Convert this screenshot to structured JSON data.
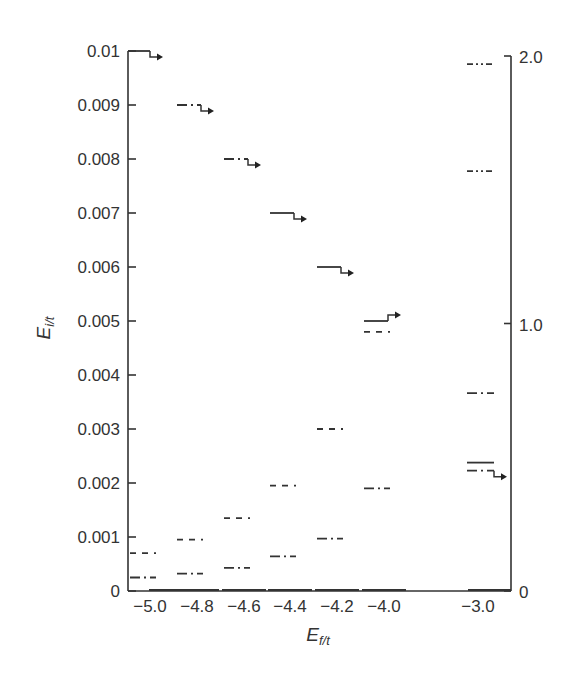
{
  "chart_data": {
    "type": "line",
    "subtype": "energy-level diagram",
    "title": "",
    "xlabel": "E_{f/t}",
    "ylabel": "E_{i/t}",
    "xlabel_main": "E",
    "xlabel_sub": "f/t",
    "ylabel_main": "E",
    "ylabel_sub": "i/t",
    "categories": [
      "−5.0",
      "−4.8",
      "−4.6",
      "−4.4",
      "−4.2",
      "−4.0",
      "−3.0"
    ],
    "left_axis": {
      "ylim": [
        0,
        0.01
      ],
      "ticks": [
        0,
        0.001,
        0.002,
        0.003,
        0.004,
        0.005,
        0.006,
        0.007,
        0.008,
        0.009,
        0.01
      ],
      "tick_labels": [
        "0",
        "0.001",
        "0.002",
        "0.003",
        "0.004",
        "0.005",
        "0.006",
        "0.007",
        "0.008",
        "0.009",
        "0.01"
      ]
    },
    "right_axis": {
      "ylim": [
        0,
        2.0
      ],
      "ticks": [
        0,
        1.0,
        2.0
      ],
      "tick_labels": [
        "0",
        "1.0",
        "2.0"
      ],
      "applies_to": "−3.0"
    },
    "grid": false,
    "legend": null,
    "groups": [
      {
        "category": "−5.0",
        "levels": [
          {
            "value": 0.0,
            "style": "solid"
          },
          {
            "value": 0.00025,
            "style": "dashdot"
          },
          {
            "value": 0.0007,
            "style": "dashed"
          },
          {
            "value": 0.01,
            "style": "solid",
            "arrow": "down"
          }
        ]
      },
      {
        "category": "−4.8",
        "levels": [
          {
            "value": 0.0,
            "style": "solid"
          },
          {
            "value": 0.00032,
            "style": "dashdot"
          },
          {
            "value": 0.00095,
            "style": "dashed"
          },
          {
            "value": 0.009,
            "style": "dashdot",
            "arrow": "down"
          }
        ]
      },
      {
        "category": "−4.6",
        "levels": [
          {
            "value": 0.0,
            "style": "solid"
          },
          {
            "value": 0.00043,
            "style": "dashdot"
          },
          {
            "value": 0.00135,
            "style": "dashed"
          },
          {
            "value": 0.008,
            "style": "dashdot",
            "arrow": "down"
          }
        ]
      },
      {
        "category": "−4.4",
        "levels": [
          {
            "value": 0.0,
            "style": "solid"
          },
          {
            "value": 0.00064,
            "style": "dashdot"
          },
          {
            "value": 0.00195,
            "style": "dashed"
          },
          {
            "value": 0.007,
            "style": "solid",
            "arrow": "down"
          }
        ]
      },
      {
        "category": "−4.2",
        "levels": [
          {
            "value": 0.0,
            "style": "solid"
          },
          {
            "value": 0.00097,
            "style": "dashdot"
          },
          {
            "value": 0.003,
            "style": "dashed"
          },
          {
            "value": 0.006,
            "style": "solid",
            "arrow": "down"
          }
        ]
      },
      {
        "category": "−4.0",
        "levels": [
          {
            "value": 0.0,
            "style": "solid"
          },
          {
            "value": 0.0019,
            "style": "dashdot"
          },
          {
            "value": 0.0048,
            "style": "dashed"
          },
          {
            "value": 0.005,
            "style": "solid",
            "arrow": "up"
          }
        ]
      },
      {
        "category": "−3.0",
        "axis": "right",
        "levels": [
          {
            "value": 0.0,
            "style": "solid"
          },
          {
            "value": 0.45,
            "style": "dashdot",
            "arrow": "down"
          },
          {
            "value": 0.48,
            "style": "solid"
          },
          {
            "value": 0.74,
            "style": "dashdot"
          },
          {
            "value": 1.57,
            "style": "dashdotdot"
          },
          {
            "value": 1.97,
            "style": "dashdotdot"
          }
        ]
      }
    ]
  }
}
